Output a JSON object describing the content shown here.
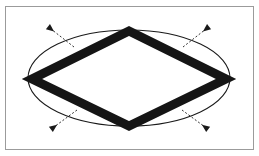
{
  "figure": {
    "caption": "",
    "background_color": "#ffffff",
    "frame": {
      "name": "figure-border",
      "x": 5,
      "y": 6,
      "width": 249,
      "height": 144,
      "stroke_color": "#9b9b9b",
      "stroke_width": 1,
      "fill_color": "#ffffff"
    }
  },
  "chart_data": {
    "type": "diagram",
    "xlabel": "",
    "ylabel": "",
    "grid": false,
    "legend": "none",
    "center": {
      "x": 129,
      "y": 78
    },
    "ellipse": {
      "label": "ellipse",
      "cx": 129,
      "cy": 78,
      "rx": 101,
      "ry": 48,
      "stroke_color": "#1a1a1a",
      "stroke_width": 1.1,
      "fill": "none"
    },
    "rhombus": {
      "label": "rhombus",
      "vertices": [
        {
          "name": "top-vertex",
          "x": 129,
          "y": 31
        },
        {
          "name": "right-vertex",
          "x": 226,
          "y": 79
        },
        {
          "name": "bottom-vertex",
          "x": 129,
          "y": 126
        },
        {
          "name": "left-vertex",
          "x": 32,
          "y": 79
        }
      ],
      "stroke_color": "#151515",
      "stroke_width": 9,
      "fill": "none",
      "closed": true
    },
    "arrows": [
      {
        "name": "arrow-northwest",
        "direction": "up-left",
        "angle_deg": 225,
        "tip": {
          "x": 51,
          "y": 29
        },
        "tail": {
          "x": 74,
          "y": 47
        },
        "dash_pattern": "2,2",
        "color": "#1a1a1a"
      },
      {
        "name": "arrow-northeast",
        "direction": "up-right",
        "angle_deg": 315,
        "tip": {
          "x": 206,
          "y": 29
        },
        "tail": {
          "x": 183,
          "y": 47
        },
        "dash_pattern": "2,2",
        "color": "#1a1a1a"
      },
      {
        "name": "arrow-southwest",
        "direction": "down-left",
        "angle_deg": 135,
        "tip": {
          "x": 54,
          "y": 127
        },
        "tail": {
          "x": 77,
          "y": 110
        },
        "dash_pattern": "2,2",
        "color": "#1a1a1a"
      },
      {
        "name": "arrow-southeast",
        "direction": "down-right",
        "angle_deg": 45,
        "tip": {
          "x": 205,
          "y": 127
        },
        "tail": {
          "x": 182,
          "y": 110
        },
        "dash_pattern": "2,2",
        "color": "#1a1a1a"
      }
    ],
    "annotations": []
  }
}
